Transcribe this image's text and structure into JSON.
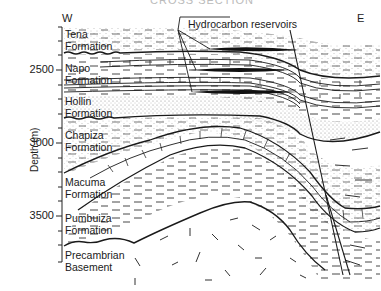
{
  "figure": {
    "cutoff_title": "CROSS SECTION",
    "direction_left": "W",
    "direction_right": "E",
    "y_axis_label": "Depth (m)",
    "y_ticks": [
      {
        "label": "2500",
        "value": 2500
      },
      {
        "label": "3000",
        "value": 3000
      },
      {
        "label": "3500",
        "value": 3500
      }
    ],
    "callout": "Hydrocarbon reservoirs",
    "formations": [
      {
        "line1": "Tena",
        "line2": "Formation"
      },
      {
        "line1": "Napo",
        "line2": "Formation"
      },
      {
        "line1": "Hollin",
        "line2": "Formation"
      },
      {
        "line1": "Chapiza",
        "line2": "Formation"
      },
      {
        "line1": "Macuma",
        "line2": "Formation"
      },
      {
        "line1": "Pumbuiza",
        "line2": "Formation"
      },
      {
        "line1": "Precambrian",
        "line2": "Basement"
      }
    ]
  },
  "colors": {
    "ink": "#1a1a1a",
    "background": "#ffffff",
    "stipple": "#9a9a9a"
  }
}
